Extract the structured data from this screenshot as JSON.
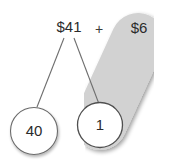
{
  "diagram": {
    "kind": "number-bond-decomposition",
    "title_label": "$41",
    "operator_label": "+",
    "addend_label": "$6",
    "nodes": [
      {
        "id": "left",
        "value": "40"
      },
      {
        "id": "right",
        "value": "1"
      }
    ],
    "highlight": {
      "name": "capsule-highlight",
      "covers": [
        "right-node",
        "addend-label"
      ]
    },
    "colors": {
      "background": "#ffffff",
      "highlight_fill": "#d2d2d2",
      "highlight_shadow": "#e3e3e3",
      "stroke": "#707070",
      "node_stroke": "#6b6b6b",
      "text": "#2b2b2b"
    }
  }
}
